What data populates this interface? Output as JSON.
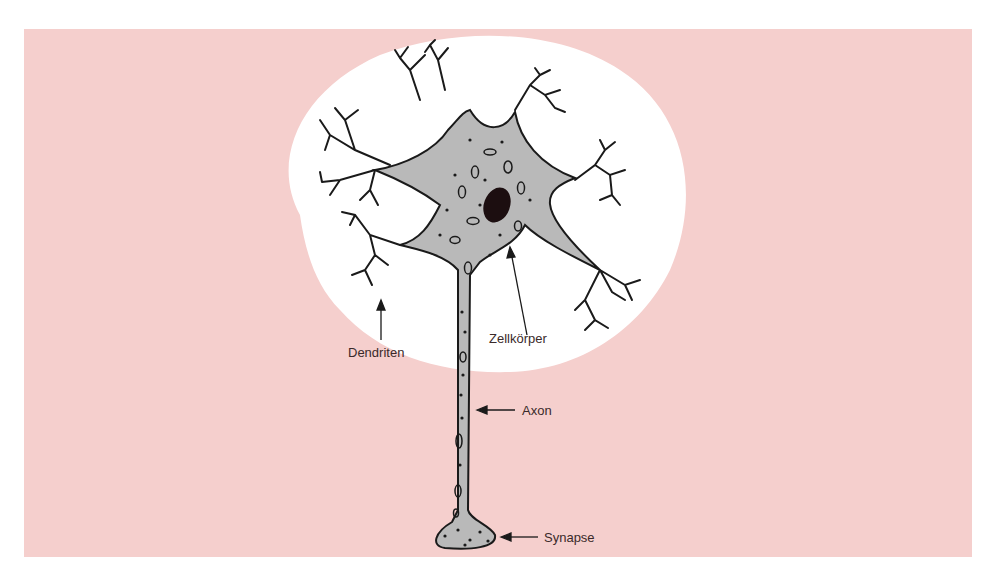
{
  "diagram": {
    "colors": {
      "background": "#f5cfcd",
      "halo": "#ffffff",
      "cell_fill": "#b9b9b9",
      "outline": "#1a1a1a",
      "nucleus": "#1c0e10",
      "label_text": "#3a2a2a"
    },
    "labels": {
      "dendrites": "Dendriten",
      "cell_body": "Zellkörper",
      "axon": "Axon",
      "synapse": "Synapse"
    }
  }
}
